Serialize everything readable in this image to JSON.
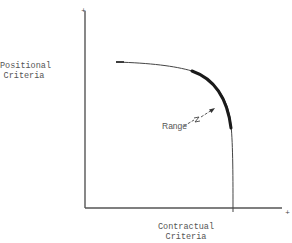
{
  "diagram": {
    "y_axis_label_line1": "Positional",
    "y_axis_label_line2": "Criteria",
    "x_axis_label_line1": "Contractual",
    "x_axis_label_line2": "Criteria",
    "range_label": "Range",
    "y_axis_end_marker": "+",
    "x_axis_end_marker": "+",
    "colors": {
      "axis": "#555555",
      "curve": "#333333",
      "range_segment": "#1a1a1a",
      "text": "#555555"
    }
  }
}
